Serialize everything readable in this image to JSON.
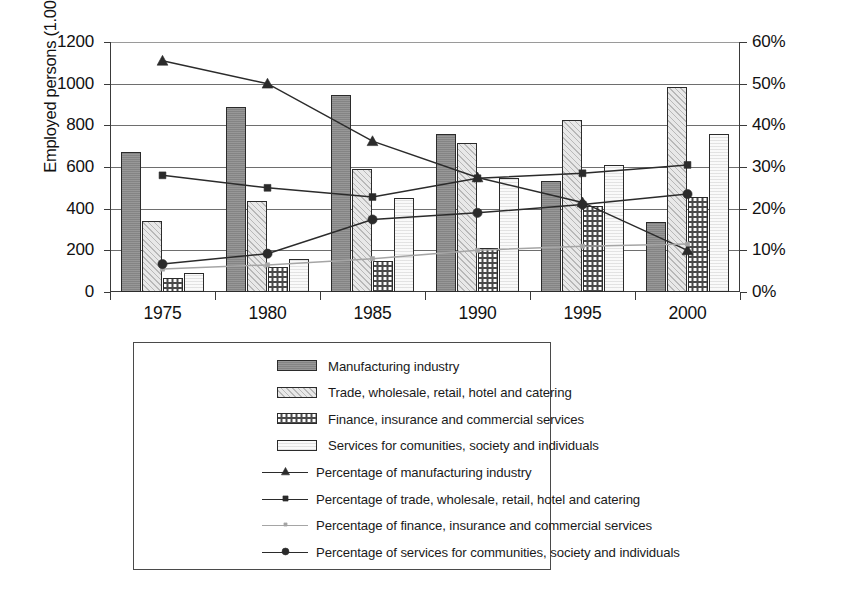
{
  "chart_data": {
    "type": "bar",
    "title": "",
    "subtitle": "",
    "xlabel": "",
    "ylabel": "Employed persons (1.000)",
    "ylabel_right": "",
    "categories": [
      "1975",
      "1980",
      "1985",
      "1990",
      "1995",
      "2000"
    ],
    "ylim": [
      0,
      1200
    ],
    "ylim_right": [
      0,
      60
    ],
    "ytick_labels_left": [
      "1200",
      "1000",
      "800",
      "600",
      "400",
      "200",
      "0"
    ],
    "ytick_values_left": [
      1200,
      1000,
      800,
      600,
      400,
      200,
      0
    ],
    "ytick_labels_right": [
      "60%",
      "50%",
      "40%",
      "30%",
      "20%",
      "10%",
      "0%"
    ],
    "ytick_values_right": [
      60,
      50,
      40,
      30,
      20,
      10,
      0
    ],
    "grid": true,
    "legend_position": "bottom",
    "bar_series": [
      {
        "name": "Manufacturing industry",
        "axis": "left",
        "fill": "dark-gray-solid",
        "values": [
          670,
          890,
          945,
          760,
          535,
          335
        ]
      },
      {
        "name": "Trade, wholesale, retail, hotel and catering",
        "axis": "left",
        "fill": "light-gray-diagonal-hatch",
        "values": [
          340,
          435,
          590,
          715,
          825,
          985
        ]
      },
      {
        "name": "Finance, insurance and commercial services",
        "axis": "left",
        "fill": "checkerboard",
        "values": [
          65,
          120,
          150,
          210,
          415,
          455
        ]
      },
      {
        "name": "Services for comunities, society and individuals",
        "axis": "left",
        "fill": "white-light",
        "values": [
          90,
          160,
          450,
          545,
          610,
          760
        ]
      }
    ],
    "line_series": [
      {
        "name": "Percentage of manufacturing industry",
        "axis": "right",
        "marker": "triangle",
        "color": "#2b2b2b",
        "values": [
          55.5,
          50.0,
          36.2,
          27.5,
          21.5,
          10.0
        ]
      },
      {
        "name": "Percentage of trade, wholesale, retail, hotel and catering",
        "axis": "right",
        "marker": "square",
        "color": "#2b2b2b",
        "values": [
          28.0,
          25.0,
          22.8,
          27.3,
          28.5,
          30.5
        ]
      },
      {
        "name": "Percentage of finance, insurance and commercial services",
        "axis": "right",
        "marker": "small-dot",
        "color": "#a5a5a5",
        "values": [
          5.5,
          6.5,
          8.0,
          10.0,
          11.0,
          11.5
        ]
      },
      {
        "name": "Percentage of services for communities, society and individuals",
        "axis": "right",
        "marker": "circle",
        "color": "#2b2b2b",
        "values": [
          6.7,
          9.2,
          17.4,
          19.0,
          21.0,
          23.5
        ]
      }
    ]
  },
  "legend": {
    "entries": [
      {
        "label": "Manufacturing industry",
        "kind": "box",
        "swatch": "sw-mfg"
      },
      {
        "label": "Trade, wholesale, retail, hotel and catering",
        "kind": "box",
        "swatch": "sw-trade"
      },
      {
        "label": "Finance, insurance and commercial services",
        "kind": "box",
        "swatch": "sw-fin"
      },
      {
        "label": "Services for comunities, society and individuals",
        "kind": "box",
        "swatch": "sw-serv"
      },
      {
        "label": "Percentage of manufacturing industry",
        "kind": "line",
        "marker": "triangle",
        "faint": false
      },
      {
        "label": "Percentage of trade, wholesale, retail, hotel and catering",
        "kind": "line",
        "marker": "square",
        "faint": false
      },
      {
        "label": "Percentage of finance, insurance and commercial services",
        "kind": "line",
        "marker": "small-dot",
        "faint": true
      },
      {
        "label": "Percentage of services for communities, society and individuals",
        "kind": "line",
        "marker": "circle",
        "faint": false
      }
    ]
  },
  "colors": {
    "axis": "#3a3a3a",
    "grid": "#6e6e6e",
    "text": "#1a1a1a",
    "mfg_bar": "#8c8c8c",
    "trade_bar": "#d8d8d8",
    "finance_bar": "#ffffff",
    "services_bar": "#f2f2f2",
    "line_dark": "#2b2b2b",
    "line_faint": "#a5a5a5"
  }
}
